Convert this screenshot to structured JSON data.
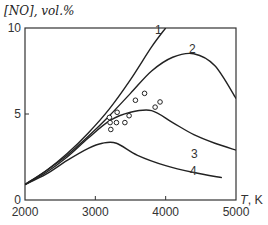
{
  "chart_data": {
    "type": "line",
    "title": "",
    "ylabel": "[NO], vol.%",
    "xlabel": "T, K",
    "xlim": [
      2000,
      5000
    ],
    "ylim": [
      0,
      10
    ],
    "x_ticks": [
      "2000",
      "3000",
      "4000",
      "5000"
    ],
    "y_ticks": [
      "0",
      "5",
      "10"
    ],
    "grid": false,
    "series": [
      {
        "name": "1",
        "x": [
          2000,
          2300,
          2600,
          2900,
          3200,
          3500,
          3800,
          4000
        ],
        "values": [
          0.9,
          1.7,
          2.7,
          3.9,
          5.3,
          7.0,
          8.9,
          10.0
        ]
      },
      {
        "name": "2",
        "x": [
          2000,
          2300,
          2600,
          2900,
          3200,
          3500,
          3800,
          4100,
          4400,
          4700,
          5000
        ],
        "values": [
          0.9,
          1.7,
          2.6,
          3.7,
          4.9,
          6.2,
          7.5,
          8.3,
          8.5,
          7.8,
          5.9
        ]
      },
      {
        "name": "3",
        "x": [
          2000,
          2300,
          2600,
          2900,
          3200,
          3500,
          3800,
          4100,
          4400,
          4700,
          5000
        ],
        "values": [
          0.9,
          1.6,
          2.5,
          3.6,
          4.6,
          5.1,
          5.2,
          4.5,
          3.8,
          3.3,
          2.9
        ]
      },
      {
        "name": "4",
        "x": [
          2000,
          2300,
          2600,
          2900,
          3100,
          3300,
          3600,
          4000,
          4400,
          4800
        ],
        "values": [
          0.9,
          1.5,
          2.3,
          3.0,
          3.3,
          3.3,
          2.6,
          2.0,
          1.6,
          1.3
        ]
      }
    ],
    "scatter": {
      "name": "experimental",
      "x": [
        3200,
        3210,
        3220,
        3310,
        3300,
        3420,
        3480,
        3570,
        3700,
        3850,
        3920
      ],
      "values": [
        4.8,
        4.5,
        4.1,
        5.1,
        4.5,
        4.5,
        4.9,
        5.8,
        6.2,
        5.4,
        5.7
      ]
    },
    "curve_labels": [
      "1",
      "2",
      "3",
      "4"
    ]
  },
  "axis": {
    "ylabel_text": "[NO], vol.%",
    "xlabel_var": "T",
    "xlabel_unit": ", K"
  }
}
